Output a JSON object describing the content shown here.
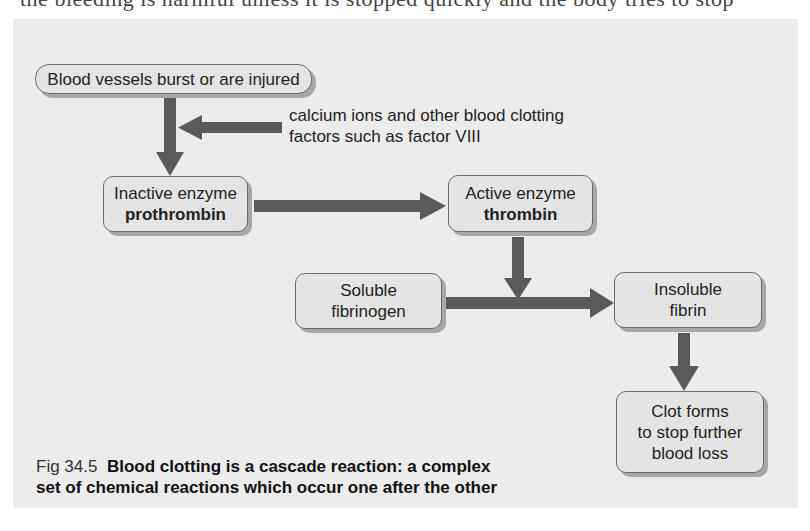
{
  "page": {
    "clipped_header_text": "the bleeding is harmful unless it is stopped quickly and the body tries to stop"
  },
  "diagram": {
    "nodes": {
      "start": {
        "label": "Blood vessels burst or are injured"
      },
      "prothrombin": {
        "line1": "Inactive enzyme",
        "line2": "prothrombin"
      },
      "thrombin": {
        "line1": "Active enzyme",
        "line2": "thrombin"
      },
      "fibrinogen": {
        "line1": "Soluble",
        "line2": "fibrinogen"
      },
      "fibrin": {
        "line1": "Insoluble",
        "line2": "fibrin"
      },
      "clot": {
        "line1": "Clot forms",
        "line2": "to stop further",
        "line3": "blood loss"
      }
    },
    "callout": {
      "line1": "calcium ions and other blood clotting",
      "line2": "factors such as factor VIII"
    },
    "edges": [
      {
        "from": "start",
        "to": "prothrombin"
      },
      {
        "from": "callout",
        "to": "start-prothrombin-edge"
      },
      {
        "from": "prothrombin",
        "to": "thrombin"
      },
      {
        "from": "thrombin",
        "to": "fibrinogen-fibrin-edge"
      },
      {
        "from": "fibrinogen",
        "to": "fibrin"
      },
      {
        "from": "fibrin",
        "to": "clot"
      }
    ],
    "colors": {
      "panel": "#ececec",
      "box_fill": "#e4e4e4",
      "box_border": "#6a6a6a",
      "arrow": "#5a5a5a"
    }
  },
  "caption": {
    "fig_number": "Fig 34.5",
    "text_line1": "Blood clotting is a cascade reaction: a complex",
    "text_line2": "set of chemical reactions which occur one after the other"
  }
}
